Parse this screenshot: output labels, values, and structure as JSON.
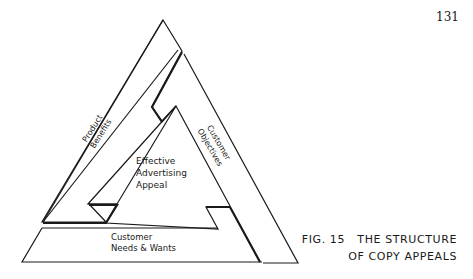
{
  "page": {
    "number": "131"
  },
  "figure": {
    "caption_line1": "FIG. 15   THE STRUCTURE",
    "caption_line2": "OF COPY APPEALS"
  },
  "diagram": {
    "center_label": [
      "Effective",
      "Advertising",
      "Appeal"
    ],
    "left_label": [
      "Product",
      "Benefits"
    ],
    "right_label": [
      "Customer",
      "Objectives"
    ],
    "bottom_label": [
      "Customer",
      "Needs & Wants"
    ]
  }
}
